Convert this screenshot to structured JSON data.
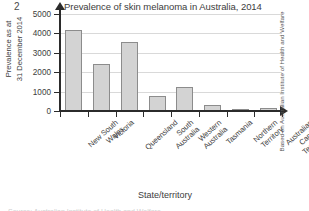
{
  "figure": {
    "number": "2",
    "title": "Prevalence of skin melanoma in Australia, 2014",
    "source_note": "Based on Australian Institute of Health and Welfare",
    "footer_clipped": "Source: Australian Institute of Health and Welfare"
  },
  "axes": {
    "y_title": "Prevalence as at\n31 December 2014",
    "x_title": "State/territory"
  },
  "chart_data": {
    "type": "bar",
    "title": "Prevalence of skin melanoma in Australia, 2014",
    "xlabel": "State/territory",
    "ylabel": "Prevalence as at 31 December 2014",
    "ylim": [
      0,
      5000
    ],
    "yticks": [
      0,
      1000,
      2000,
      3000,
      4000,
      5000
    ],
    "ytick_labels": [
      "0",
      "1000",
      "2000",
      "3000",
      "4000",
      "5000"
    ],
    "grid": true,
    "legend": false,
    "bar_color": "#d3d3d3",
    "bar_edge_color": "#8c8c8c",
    "categories": [
      "New South Wales",
      "Victoria",
      "Queensland",
      "South Australia",
      "Western Australia",
      "Tasmania",
      "Northern Territory",
      "Australian Capital Territory"
    ],
    "category_labels": [
      "New South\nWales",
      "Victoria",
      "Queensland",
      "South\nAustralia",
      "Western\nAustralia",
      "Tasmania",
      "Northern\nTerritory",
      "Australian\nCapital Territory"
    ],
    "values": [
      4200,
      2430,
      3580,
      780,
      1250,
      300,
      90,
      160
    ]
  }
}
